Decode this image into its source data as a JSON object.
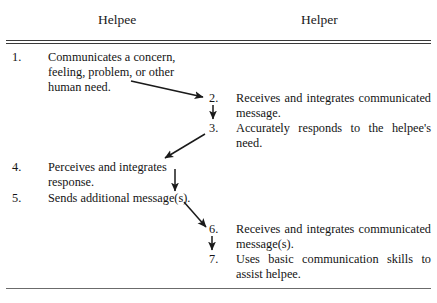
{
  "document": {
    "columns": [
      {
        "id": "helpee",
        "label": "Helpee"
      },
      {
        "id": "helper",
        "label": "Helper"
      }
    ],
    "steps": [
      {
        "number": "1.",
        "column": "helpee",
        "text": "Communicates a concern, feeling, problem, or other human need."
      },
      {
        "number": "2.",
        "column": "helper",
        "text": "Receives and integrates communicated message."
      },
      {
        "number": "3.",
        "column": "helper",
        "text": "Accurately responds to the helpee's need."
      },
      {
        "number": "4.",
        "column": "helpee",
        "text": "Perceives and integrates response."
      },
      {
        "number": "5.",
        "column": "helpee",
        "text": "Sends additional mes­sage(s)."
      },
      {
        "number": "6.",
        "column": "helper",
        "text": "Receives and integrates communicated message(s)."
      },
      {
        "number": "7.",
        "column": "helper",
        "text": "Uses basic communication skills to assist helpee."
      }
    ],
    "flow_arrows": [
      {
        "from": "1",
        "to": "2",
        "direction": "diagonal-down-right"
      },
      {
        "from": "2",
        "to": "3",
        "direction": "down"
      },
      {
        "from": "3",
        "to": "4",
        "direction": "diagonal-down-left"
      },
      {
        "from": "4",
        "to": "5",
        "direction": "down"
      },
      {
        "from": "5",
        "to": "6",
        "direction": "diagonal-down-right"
      },
      {
        "from": "6",
        "to": "7",
        "direction": "down"
      }
    ],
    "colors": {
      "background": "#ffffff",
      "text": "#141414",
      "rule": "#3a3a3a",
      "arrow": "#1a1a1a"
    }
  }
}
